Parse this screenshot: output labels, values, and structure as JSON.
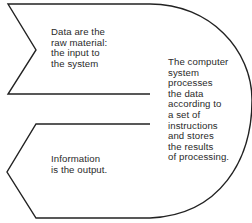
{
  "diagram": {
    "type": "data-processing-flow",
    "stroke_color": "#222222",
    "background": "#ffffff",
    "input": {
      "shape": "right-pointing notched band",
      "text": "Data are the\nraw material:\nthe input to\nthe system"
    },
    "process": {
      "shape": "arc",
      "text": "The computer\nsystem\nprocesses\nthe data\naccording to\na set of\ninstructions\nand stores\nthe results\nof processing."
    },
    "output": {
      "shape": "left-pointing arrow band",
      "text": "Information\nis the output."
    }
  }
}
